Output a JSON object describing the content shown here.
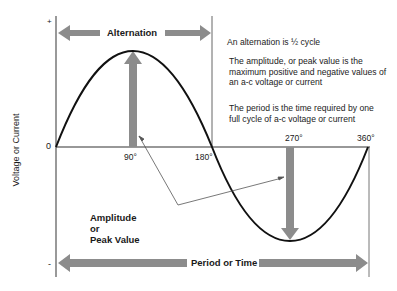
{
  "diagram": {
    "axis": {
      "ylabel": "Voltage or Current",
      "plus_label": "+",
      "minus_label": "-",
      "zero_label": "0",
      "x_ticks": [
        "90°",
        "180°",
        "270°",
        "360°"
      ]
    },
    "arrows": {
      "alternation": "Alternation",
      "period": "Period or Time",
      "amplitude_line1": "Amplitude",
      "amplitude_line2": "or",
      "amplitude_line3": "Peak Value"
    },
    "notes": {
      "alternation_note": "An alternation is ½ cycle",
      "amplitude_note": "The amplitude, or peak value is the maximum positive and negative values of an a-c voltage or current",
      "period_note": "The period is the time required by one full cycle of a-c voltage or current"
    },
    "colors": {
      "arrow_fill": "#8c8c8c",
      "curve": "#111111",
      "axis": "#555555"
    }
  }
}
